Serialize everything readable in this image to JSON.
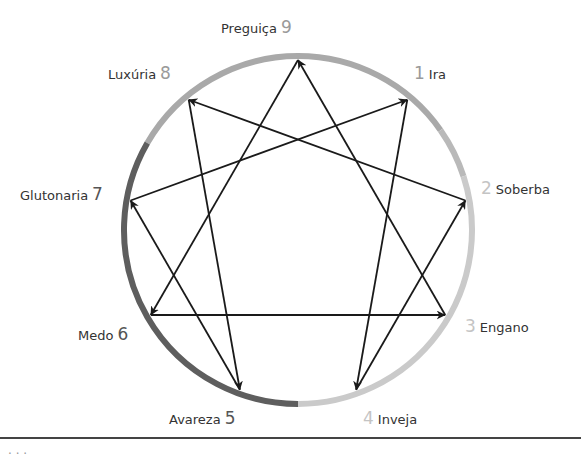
{
  "diagram": {
    "type": "enneagram",
    "center": [
      298,
      230
    ],
    "radius": 174,
    "ring_width": 6,
    "ring_segments": [
      {
        "name": "top",
        "from_point": "8",
        "to_point": "2",
        "color": "#a9a9a9"
      },
      {
        "name": "right",
        "from_point": "2",
        "to_point": "bottom",
        "color": "#cacaca"
      },
      {
        "name": "left",
        "from_point": "bottom",
        "to_point": "7.5",
        "color": "#5e5e5e"
      }
    ],
    "points": [
      {
        "num": "9",
        "name": "Preguiça",
        "num_color": "#9a9a9a"
      },
      {
        "num": "1",
        "name": "Ira",
        "num_color": "#9a9a9a"
      },
      {
        "num": "2",
        "name": "Soberba",
        "num_color": "#c4c4c4"
      },
      {
        "num": "3",
        "name": "Engano",
        "num_color": "#c4c4c4"
      },
      {
        "num": "4",
        "name": "Inveja",
        "num_color": "#c4c4c4"
      },
      {
        "num": "5",
        "name": "Avareza",
        "num_color": "#555555"
      },
      {
        "num": "6",
        "name": "Medo",
        "num_color": "#555555"
      },
      {
        "num": "7",
        "name": "Glutonaria",
        "num_color": "#555555"
      },
      {
        "num": "8",
        "name": "Luxúria",
        "num_color": "#9a9a9a"
      }
    ],
    "arrows": [
      {
        "from": "9",
        "to": "6"
      },
      {
        "from": "6",
        "to": "3"
      },
      {
        "from": "3",
        "to": "9"
      },
      {
        "from": "1",
        "to": "4"
      },
      {
        "from": "4",
        "to": "2"
      },
      {
        "from": "2",
        "to": "8"
      },
      {
        "from": "8",
        "to": "5"
      },
      {
        "from": "5",
        "to": "7"
      },
      {
        "from": "7",
        "to": "1"
      }
    ]
  },
  "labels": {
    "p9": {
      "name": "Preguiça",
      "num": "9"
    },
    "p1": {
      "num": "1",
      "name": "Ira"
    },
    "p2": {
      "num": "2",
      "name": "Soberba"
    },
    "p3": {
      "num": "3",
      "name": "Engano"
    },
    "p4": {
      "num": "4",
      "name": "Inveja"
    },
    "p5": {
      "name": "Avareza",
      "num": "5"
    },
    "p6": {
      "name": "Medo",
      "num": "6"
    },
    "p7": {
      "name": "Glutonaria",
      "num": "7"
    },
    "p8": {
      "name": "Luxúria",
      "num": "8"
    }
  },
  "caption": {
    "text": "· · ·"
  }
}
